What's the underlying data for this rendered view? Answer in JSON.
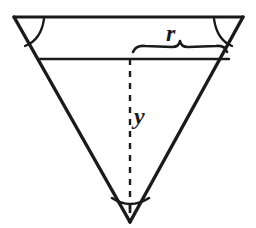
{
  "figure": {
    "background_color": "#ffffff",
    "stroke_color": "#1a1a1a",
    "width": 256,
    "height": 228
  },
  "labels": {
    "radius_label": "r",
    "depth_label": "y"
  },
  "geometry": {
    "apex": {
      "x": 130,
      "y": 222
    },
    "top_left_vertex": {
      "x": 14,
      "y": 17
    },
    "top_right_vertex": {
      "x": 243,
      "y": 17
    },
    "top_chord": {
      "x1": 14,
      "y1": 17,
      "x2": 243,
      "y2": 17
    },
    "water_surface_chord": {
      "x1": 41,
      "y1": 59,
      "x2": 228,
      "y2": 59
    },
    "depth_line": {
      "x1": 130,
      "y1": 59,
      "x2": 130,
      "y2": 214,
      "style": "dashed"
    },
    "brace": {
      "x_start": 133,
      "x_end": 226,
      "y": 50,
      "peak_x": 180
    },
    "angle_arcs": [
      {
        "name": "top-left-angle",
        "vertex_x": 14,
        "vertex_y": 17
      },
      {
        "name": "top-right-angle",
        "vertex_x": 243,
        "vertex_y": 17
      },
      {
        "name": "apex-angle",
        "vertex_x": 130,
        "vertex_y": 222
      }
    ]
  }
}
